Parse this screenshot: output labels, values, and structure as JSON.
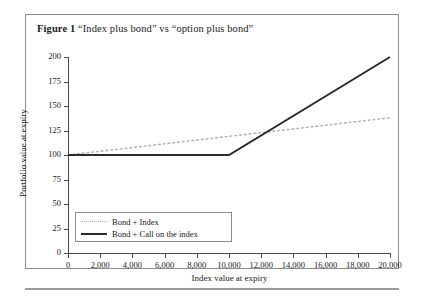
{
  "figure": {
    "caption_label": "Figure 1",
    "caption_text": "“Index plus bond” vs “option plus bond”"
  },
  "legend": {
    "position": "bottom-left-inside",
    "items": [
      {
        "label": "Bond + Index",
        "style": "dotted",
        "color": "#b4b4b4"
      },
      {
        "label": "Bond + Call on the index",
        "style": "solid",
        "color": "#2b2b2b"
      }
    ]
  },
  "chart_data": {
    "type": "line",
    "title": "“Index plus bond” vs “option plus bond”",
    "xlabel": "Index value at expiry",
    "ylabel": "Portfolio value at expiry",
    "xlim": [
      0,
      20000
    ],
    "ylim": [
      0,
      200
    ],
    "xticks": [
      0,
      2000,
      4000,
      6000,
      8000,
      10000,
      12000,
      14000,
      16000,
      18000,
      20000
    ],
    "xticklabels": [
      "0",
      "2,000",
      "4,000",
      "6,000",
      "8,000",
      "10,000",
      "12,000",
      "14,000",
      "16,000",
      "18,000",
      "20,000"
    ],
    "yticks": [
      0,
      25,
      50,
      75,
      100,
      125,
      150,
      175,
      200
    ],
    "yticklabels": [
      "0",
      "25",
      "50",
      "75",
      "100",
      "125",
      "150",
      "175",
      "200"
    ],
    "grid": false,
    "series": [
      {
        "name": "Bond + Index",
        "style": "dotted",
        "color": "#b4b4b4",
        "x": [
          0,
          20000
        ],
        "values": [
          100,
          138
        ]
      },
      {
        "name": "Bond + Call on the index",
        "style": "solid",
        "color": "#2b2b2b",
        "x": [
          0,
          10000,
          20000
        ],
        "values": [
          100,
          100,
          200
        ]
      }
    ]
  }
}
